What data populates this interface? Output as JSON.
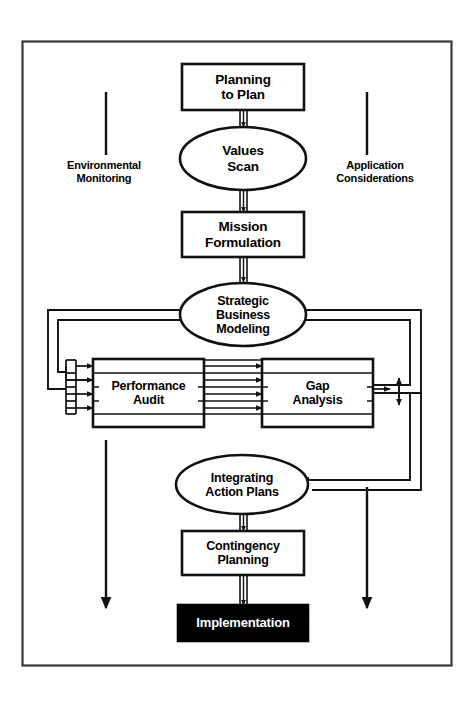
{
  "diagram": {
    "colors": {
      "stroke": "#111111",
      "fill": "#ffffff",
      "inverted_fill": "#000000",
      "inverted_text": "#ffffff",
      "border": "#3a3a3a"
    },
    "nodes": [
      {
        "id": "planning-to-plan",
        "shape": "rect",
        "lines": [
          "Planning",
          "to Plan"
        ],
        "x": 182,
        "y": 64,
        "w": 122,
        "h": 46,
        "font_size": 13.5
      },
      {
        "id": "values-scan",
        "shape": "ellipse",
        "lines": [
          "Values",
          "Scan"
        ],
        "x": 180,
        "y": 127,
        "w": 126,
        "h": 63,
        "font_size": 13.5
      },
      {
        "id": "mission-formulation",
        "shape": "rect",
        "lines": [
          "Mission",
          "Formulation"
        ],
        "x": 182,
        "y": 212,
        "w": 122,
        "h": 45,
        "font_size": 13.5
      },
      {
        "id": "strategic-business-modeling",
        "shape": "ellipse",
        "lines": [
          "Strategic",
          "Business",
          "Modeling"
        ],
        "x": 180,
        "y": 283,
        "w": 126,
        "h": 63,
        "font_size": 12.5
      },
      {
        "id": "performance-audit",
        "shape": "banded",
        "lines": [
          "Performance",
          "Audit"
        ],
        "x": 93,
        "y": 359,
        "w": 111,
        "h": 68,
        "font_size": 12.5,
        "bands": 4
      },
      {
        "id": "gap-analysis",
        "shape": "banded",
        "lines": [
          "Gap",
          "Analysis"
        ],
        "x": 262,
        "y": 359,
        "w": 111,
        "h": 68,
        "font_size": 12.5,
        "bands": 4
      },
      {
        "id": "integrating-action-plans",
        "shape": "ellipse",
        "lines": [
          "Integrating",
          "Action Plans"
        ],
        "x": 176,
        "y": 455,
        "w": 132,
        "h": 59,
        "font_size": 12.5
      },
      {
        "id": "contingency-planning",
        "shape": "rect",
        "lines": [
          "Contingency",
          "Planning"
        ],
        "x": 182,
        "y": 531,
        "w": 122,
        "h": 44,
        "font_size": 12.5
      },
      {
        "id": "implementation",
        "shape": "rect-filled",
        "lines": [
          "Implementation"
        ],
        "x": 178,
        "y": 605,
        "w": 130,
        "h": 36,
        "font_size": 13
      }
    ],
    "side_labels": [
      {
        "id": "environmental-monitoring",
        "lines": [
          "Environmental",
          "Monitoring"
        ],
        "x": 41,
        "y": 160,
        "w": 126
      },
      {
        "id": "application-considerations",
        "lines": [
          "Application",
          "Considerations"
        ],
        "x": 310,
        "y": 160,
        "w": 136
      }
    ],
    "side_rails": [
      {
        "id": "left-rail",
        "x": 106,
        "y1": 92,
        "y2": 155
      },
      {
        "id": "left-rail-lower",
        "x": 106,
        "y1": 445,
        "y2": 612
      },
      {
        "id": "right-rail",
        "x": 367,
        "y1": 92,
        "y2": 155
      },
      {
        "id": "right-rail-lower",
        "x": 367,
        "y1": 487,
        "y2": 612
      }
    ],
    "connector_labels": {
      "down_double": "double-line-down-arrow",
      "feedback_left": "left-feedback-loop",
      "feedback_right": "right-feedback-loop",
      "cross_arrows": "performance-to-gap-arrows"
    },
    "counts": {
      "cross_arrows": 4,
      "left_feed_arrows": 4,
      "bands_per_box": 4
    }
  }
}
